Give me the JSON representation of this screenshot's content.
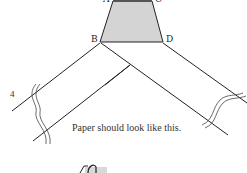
{
  "diagram": {
    "step_number": "4",
    "caption": "Paper should look like this.",
    "points": {
      "A": "A",
      "B": "B",
      "C": "C",
      "D": "D"
    },
    "colors": {
      "shaded_fill": "#d4d4d4",
      "line": "#222222",
      "top_edge": "#555555"
    }
  }
}
